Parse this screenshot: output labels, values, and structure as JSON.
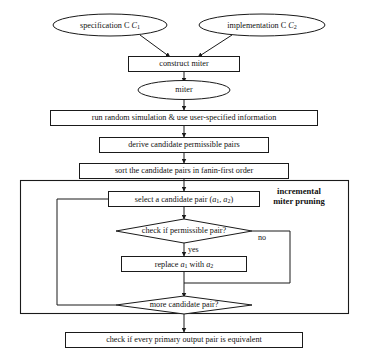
{
  "diagram": {
    "type": "flowchart",
    "colors": {
      "background": "#ffffff",
      "stroke": "#1a1a1a",
      "text": "#111111",
      "node_fill": "#ffffff"
    },
    "nodes": {
      "specification": {
        "shape": "ellipse",
        "text": "specification C",
        "subscript": "1"
      },
      "implementation": {
        "shape": "ellipse",
        "text": "implementation C",
        "subscript": "2"
      },
      "construct_miter": {
        "shape": "rectangle",
        "text": "construct miter"
      },
      "miter": {
        "shape": "ellipse",
        "text": "miter"
      },
      "run_simulation": {
        "shape": "rectangle",
        "text": "run random simulation & use user-specified information"
      },
      "derive_pairs": {
        "shape": "rectangle",
        "text": "derive candidate permissible pairs"
      },
      "sort_pairs": {
        "shape": "rectangle",
        "text": "sort the candidate pairs in fanin-first order"
      },
      "select_pair": {
        "shape": "rectangle",
        "text_prefix": "select a candidate pair (",
        "var1": "a",
        "sub1": "1",
        "separator": ", ",
        "var2": "a",
        "sub2": "2",
        "text_suffix": ")"
      },
      "check_permissible": {
        "shape": "diamond",
        "text": "check if permissible pair?"
      },
      "replace_pair": {
        "shape": "rectangle",
        "text_prefix": "replace ",
        "var1": "a",
        "sub1": "1",
        "text_middle": " with ",
        "var2": "a",
        "sub2": "2"
      },
      "more_pairs": {
        "shape": "diamond",
        "text": "more candidate pair?"
      },
      "check_equivalent": {
        "shape": "rectangle",
        "text": "check if every primary output pair is equivalent"
      }
    },
    "edge_labels": {
      "no": "no",
      "yes": "yes"
    },
    "group": {
      "label_line1": "incremental",
      "label_line2": "miter pruning"
    }
  }
}
